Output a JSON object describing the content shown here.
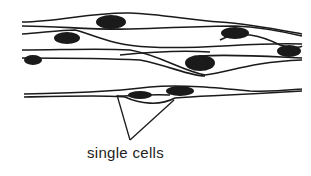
{
  "diagram": {
    "label": "single cells",
    "colors": {
      "line": "#1a1a1a",
      "nucleus": "#1a1a1a",
      "background": "#ffffff"
    }
  }
}
